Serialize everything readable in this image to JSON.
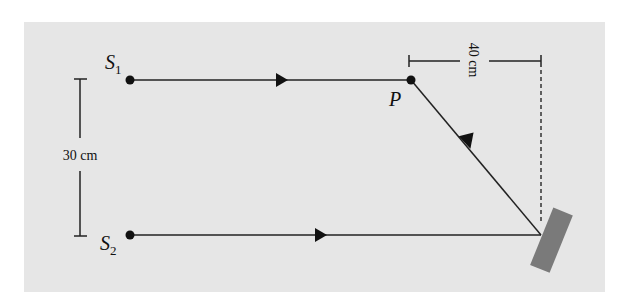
{
  "diagram": {
    "type": "physics-interference-setup",
    "colors": {
      "background_panel": "#e6e6e6",
      "line": "#222222",
      "mirror": "#7a7a7a",
      "page": "#ffffff"
    },
    "labels": {
      "source_1": "S",
      "source_1_sub": "1",
      "source_2": "S",
      "source_2_sub": "2",
      "point_p": "P",
      "vertical_distance": "30 cm",
      "horizontal_distance": "40 cm"
    },
    "elements": {
      "source_1": {
        "x": 130,
        "y": 80
      },
      "source_2": {
        "x": 130,
        "y": 235
      },
      "point_p": {
        "x": 411,
        "y": 80
      },
      "mirror_reflection_point": {
        "x": 541,
        "y": 235
      }
    },
    "paths": [
      {
        "name": "direct-ray",
        "from": "S1",
        "to": "P",
        "arrow_direction": "right"
      },
      {
        "name": "incident-ray",
        "from": "S2",
        "to": "mirror",
        "arrow_direction": "right"
      },
      {
        "name": "reflected-ray",
        "from": "mirror",
        "to": "P",
        "arrow_direction": "up-left"
      }
    ]
  }
}
